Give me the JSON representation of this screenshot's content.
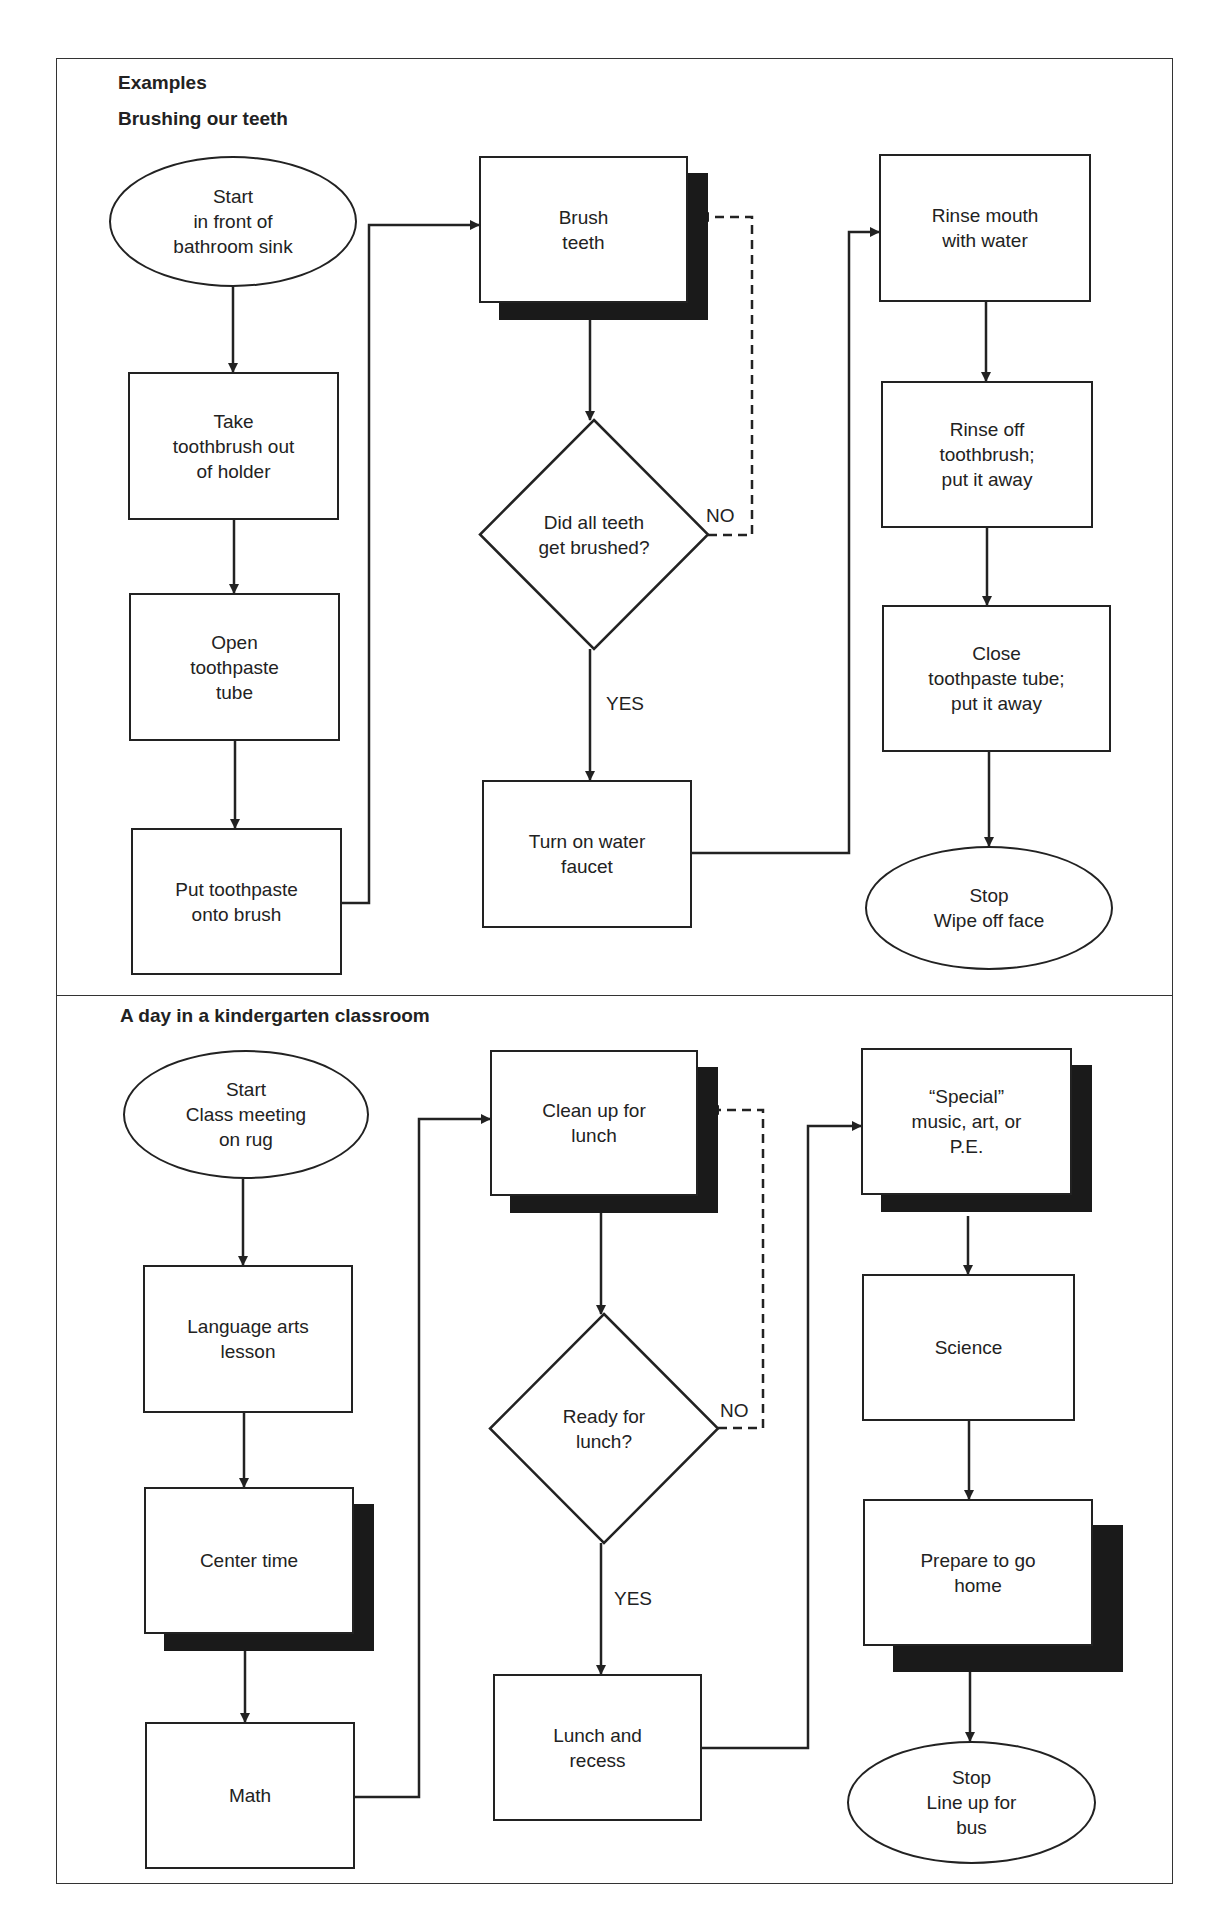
{
  "document": {
    "title": "Examples",
    "colors": {
      "ink": "#222222",
      "shadow": "#1a1a1a",
      "background": "#ffffff"
    }
  },
  "frame": {
    "x": 56,
    "y": 58,
    "w": 1117,
    "h": 1826,
    "divider_y": 995
  },
  "sections": [
    {
      "id": "brushing",
      "title": "Brushing our teeth",
      "title_pos": {
        "x": 118,
        "y": 108
      },
      "nodes": [
        {
          "id": "b_start",
          "type": "ellipse",
          "label": "Start\nin front of\nbathroom sink",
          "x": 109,
          "y": 156,
          "w": 248,
          "h": 131
        },
        {
          "id": "b_take",
          "type": "box",
          "label": "Take\ntoothbrush out\nof holder",
          "x": 128,
          "y": 372,
          "w": 211,
          "h": 148
        },
        {
          "id": "b_open",
          "type": "box",
          "label": "Open\ntoothpaste\ntube",
          "x": 129,
          "y": 593,
          "w": 211,
          "h": 148
        },
        {
          "id": "b_put",
          "type": "box",
          "label": "Put toothpaste\nonto brush",
          "x": 131,
          "y": 828,
          "w": 211,
          "h": 147
        },
        {
          "id": "b_brush",
          "type": "box",
          "shadow": true,
          "label": "Brush\nteeth",
          "x": 479,
          "y": 156,
          "w": 209,
          "h": 147
        },
        {
          "id": "b_check",
          "type": "diamond",
          "label": "Did all teeth\nget brushed?",
          "x": 480,
          "y": 420,
          "w": 228,
          "h": 229
        },
        {
          "id": "b_water",
          "type": "box",
          "label": "Turn on water\nfaucet",
          "x": 482,
          "y": 780,
          "w": 210,
          "h": 148
        },
        {
          "id": "b_rinse_mouth",
          "type": "box",
          "label": "Rinse mouth\nwith water",
          "x": 879,
          "y": 154,
          "w": 212,
          "h": 148
        },
        {
          "id": "b_rinse_brush",
          "type": "box",
          "label": "Rinse off\ntoothbrush;\nput it away",
          "x": 881,
          "y": 381,
          "w": 212,
          "h": 147
        },
        {
          "id": "b_close",
          "type": "box",
          "label": "Close\ntoothpaste tube;\nput it away",
          "x": 882,
          "y": 605,
          "w": 229,
          "h": 147
        },
        {
          "id": "b_stop",
          "type": "ellipse",
          "label": "Stop\nWipe off face",
          "x": 865,
          "y": 846,
          "w": 248,
          "h": 124
        }
      ],
      "edge_labels": [
        {
          "text": "NO",
          "x": 706,
          "y": 505
        },
        {
          "text": "YES",
          "x": 606,
          "y": 693
        }
      ]
    },
    {
      "id": "kindergarten",
      "title": "A day in a kindergarten classroom",
      "title_pos": {
        "x": 120,
        "y": 1005
      },
      "nodes": [
        {
          "id": "k_start",
          "type": "ellipse",
          "label": "Start\nClass meeting\non rug",
          "x": 123,
          "y": 1050,
          "w": 246,
          "h": 129
        },
        {
          "id": "k_lang",
          "type": "box",
          "label": "Language arts\nlesson",
          "x": 143,
          "y": 1265,
          "w": 210,
          "h": 148
        },
        {
          "id": "k_center",
          "type": "box",
          "shadow": true,
          "label": "Center time",
          "x": 144,
          "y": 1487,
          "w": 210,
          "h": 147
        },
        {
          "id": "k_math",
          "type": "box",
          "label": "Math",
          "x": 145,
          "y": 1722,
          "w": 210,
          "h": 147
        },
        {
          "id": "k_clean",
          "type": "box",
          "shadow": true,
          "label": "Clean up for\nlunch",
          "x": 490,
          "y": 1050,
          "w": 208,
          "h": 146
        },
        {
          "id": "k_ready",
          "type": "diamond",
          "label": "Ready for\nlunch?",
          "x": 490,
          "y": 1314,
          "w": 228,
          "h": 229
        },
        {
          "id": "k_lunch",
          "type": "box",
          "label": "Lunch and\nrecess",
          "x": 493,
          "y": 1674,
          "w": 209,
          "h": 147
        },
        {
          "id": "k_special",
          "type": "box",
          "shadow": true,
          "label": "“Special”\nmusic, art, or\nP.E.",
          "x": 861,
          "y": 1048,
          "w": 211,
          "h": 147
        },
        {
          "id": "k_science",
          "type": "box",
          "label": "Science",
          "x": 862,
          "y": 1274,
          "w": 213,
          "h": 147
        },
        {
          "id": "k_prepare",
          "type": "box",
          "shadow": true,
          "big_shadow": true,
          "label": "Prepare to go\nhome",
          "x": 863,
          "y": 1499,
          "w": 230,
          "h": 147
        },
        {
          "id": "k_stop",
          "type": "ellipse",
          "label": "Stop\nLine up for\nbus",
          "x": 847,
          "y": 1741,
          "w": 249,
          "h": 123
        }
      ],
      "edge_labels": [
        {
          "text": "NO",
          "x": 720,
          "y": 1400
        },
        {
          "text": "YES",
          "x": 614,
          "y": 1588
        }
      ]
    }
  ],
  "edges": [
    {
      "id": "e1",
      "style": "solid",
      "arrow": true,
      "points": [
        [
          233,
          287
        ],
        [
          233,
          372
        ]
      ]
    },
    {
      "id": "e2",
      "style": "solid",
      "arrow": true,
      "points": [
        [
          234,
          520
        ],
        [
          234,
          593
        ]
      ]
    },
    {
      "id": "e3",
      "style": "solid",
      "arrow": true,
      "points": [
        [
          235,
          741
        ],
        [
          235,
          828
        ]
      ]
    },
    {
      "id": "e4",
      "style": "solid",
      "arrow": true,
      "points": [
        [
          342,
          903
        ],
        [
          369,
          903
        ],
        [
          369,
          225
        ],
        [
          479,
          225
        ]
      ]
    },
    {
      "id": "e5",
      "style": "solid",
      "arrow": true,
      "points": [
        [
          590,
          319
        ],
        [
          590,
          420
        ]
      ]
    },
    {
      "id": "e6",
      "style": "dashed",
      "arrow": true,
      "points": [
        [
          708,
          535
        ],
        [
          752,
          535
        ],
        [
          752,
          217
        ],
        [
          700,
          217
        ]
      ]
    },
    {
      "id": "e7",
      "style": "solid",
      "arrow": true,
      "points": [
        [
          590,
          649
        ],
        [
          590,
          780
        ]
      ]
    },
    {
      "id": "e8",
      "style": "solid",
      "arrow": true,
      "points": [
        [
          692,
          853
        ],
        [
          849,
          853
        ],
        [
          849,
          232
        ],
        [
          879,
          232
        ]
      ]
    },
    {
      "id": "e9",
      "style": "solid",
      "arrow": true,
      "points": [
        [
          986,
          302
        ],
        [
          986,
          381
        ]
      ]
    },
    {
      "id": "e10",
      "style": "solid",
      "arrow": true,
      "points": [
        [
          987,
          528
        ],
        [
          987,
          605
        ]
      ]
    },
    {
      "id": "e11",
      "style": "solid",
      "arrow": true,
      "points": [
        [
          989,
          752
        ],
        [
          989,
          846
        ]
      ]
    },
    {
      "id": "k1",
      "style": "solid",
      "arrow": true,
      "points": [
        [
          243,
          1179
        ],
        [
          243,
          1265
        ]
      ]
    },
    {
      "id": "k2",
      "style": "solid",
      "arrow": true,
      "points": [
        [
          244,
          1413
        ],
        [
          244,
          1487
        ]
      ]
    },
    {
      "id": "k3",
      "style": "solid",
      "arrow": true,
      "points": [
        [
          245,
          1649
        ],
        [
          245,
          1722
        ]
      ]
    },
    {
      "id": "k4",
      "style": "solid",
      "arrow": true,
      "points": [
        [
          355,
          1797
        ],
        [
          419,
          1797
        ],
        [
          419,
          1119
        ],
        [
          490,
          1119
        ]
      ]
    },
    {
      "id": "k5",
      "style": "solid",
      "arrow": true,
      "points": [
        [
          601,
          1213
        ],
        [
          601,
          1314
        ]
      ]
    },
    {
      "id": "k6",
      "style": "dashed",
      "arrow": true,
      "points": [
        [
          718,
          1428
        ],
        [
          763,
          1428
        ],
        [
          763,
          1110
        ],
        [
          710,
          1110
        ]
      ]
    },
    {
      "id": "k7",
      "style": "solid",
      "arrow": true,
      "points": [
        [
          601,
          1543
        ],
        [
          601,
          1674
        ]
      ]
    },
    {
      "id": "k8",
      "style": "solid",
      "arrow": true,
      "points": [
        [
          702,
          1748
        ],
        [
          808,
          1748
        ],
        [
          808,
          1126
        ],
        [
          861,
          1126
        ]
      ]
    },
    {
      "id": "k9",
      "style": "solid",
      "arrow": true,
      "points": [
        [
          968,
          1216
        ],
        [
          968,
          1274
        ]
      ]
    },
    {
      "id": "k10",
      "style": "solid",
      "arrow": true,
      "points": [
        [
          969,
          1421
        ],
        [
          969,
          1499
        ]
      ]
    },
    {
      "id": "k11",
      "style": "solid",
      "arrow": true,
      "points": [
        [
          970,
          1672
        ],
        [
          970,
          1741
        ]
      ]
    }
  ]
}
